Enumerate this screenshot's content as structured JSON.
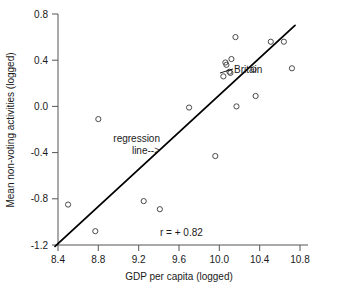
{
  "chart_data": {
    "type": "scatter",
    "title": "",
    "xlabel": "GDP per capita (logged)",
    "ylabel": "Mean non-voting activities (logged)",
    "xlim": [
      8.4,
      10.8
    ],
    "ylim": [
      -1.2,
      0.8
    ],
    "xticks": [
      "8.4",
      "8.8",
      "9.2",
      "9.6",
      "10.0",
      "10.4",
      "10.8"
    ],
    "xtick_values": [
      8.4,
      8.8,
      9.2,
      9.6,
      10.0,
      10.4,
      10.8
    ],
    "yticks": [
      "0.8",
      "0.4",
      "0.0",
      "-0.4",
      "-0.8",
      "-1.2"
    ],
    "ytick_values": [
      0.8,
      0.4,
      0.0,
      -0.4,
      -0.8,
      -1.2
    ],
    "grid": false,
    "legend": "none",
    "marker": "open-circle",
    "points": [
      {
        "x": 8.5,
        "y": -0.85
      },
      {
        "x": 8.77,
        "y": -1.08
      },
      {
        "x": 8.8,
        "y": -0.11
      },
      {
        "x": 9.25,
        "y": -0.82
      },
      {
        "x": 9.41,
        "y": -0.89
      },
      {
        "x": 9.7,
        "y": -0.01
      },
      {
        "x": 9.96,
        "y": -0.43
      },
      {
        "x": 10.04,
        "y": 0.26
      },
      {
        "x": 10.06,
        "y": 0.38
      },
      {
        "x": 10.07,
        "y": 0.36
      },
      {
        "x": 10.1,
        "y": 0.3
      },
      {
        "x": 10.11,
        "y": 0.29
      },
      {
        "x": 10.12,
        "y": 0.41
      },
      {
        "x": 10.16,
        "y": 0.6
      },
      {
        "x": 10.17,
        "y": 0.0
      },
      {
        "x": 10.34,
        "y": 0.32
      },
      {
        "x": 10.36,
        "y": 0.09
      },
      {
        "x": 10.51,
        "y": 0.56
      },
      {
        "x": 10.64,
        "y": 0.56
      },
      {
        "x": 10.72,
        "y": 0.33
      }
    ],
    "highlighted_point": {
      "label": "Britain",
      "x": 10.34,
      "y": 0.32
    },
    "regression_line": {
      "label_line_1": "regression",
      "label_line_2": "line-->",
      "x1": 8.37,
      "y1": -1.12,
      "x2": 10.75,
      "y2": 0.7
    },
    "annotation_r": "r = + 0.82"
  }
}
